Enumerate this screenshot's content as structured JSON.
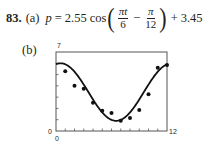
{
  "problem": {
    "number": "83.",
    "part_a_label": "(a)",
    "lhs": "p",
    "equals": "=",
    "amplitude": "2.55",
    "func": "cos",
    "frac1_num": "πt",
    "frac1_den": "6",
    "minus": "−",
    "frac2_num": "π",
    "frac2_den": "12",
    "plus": "+",
    "shift": "3.45",
    "part_b_label": "(b)"
  },
  "chart_data": {
    "type": "scatter",
    "title": "",
    "xlabel": "",
    "ylabel": "",
    "xlim": [
      0,
      12
    ],
    "ylim": [
      0,
      7
    ],
    "x_tick_labels": {
      "min": "0",
      "max": "12"
    },
    "y_tick_labels": {
      "min": "0",
      "max": "7"
    },
    "x_ticks": 12,
    "y_ticks": 7,
    "grid": false,
    "series": [
      {
        "name": "data",
        "type": "scatter",
        "x": [
          1,
          2,
          3,
          4,
          5,
          6,
          7,
          8,
          9,
          10,
          11,
          12
        ],
        "y": [
          5.3,
          4.0,
          3.75,
          2.5,
          1.8,
          1.6,
          0.9,
          1.15,
          1.85,
          3.25,
          5.6,
          5.85
        ]
      },
      {
        "name": "model",
        "type": "line",
        "formula": "p = 2.55 cos(πt/6 − π/12) + 3.45",
        "amplitude": 2.55,
        "period": 12,
        "phase": 0.2618,
        "vertical_shift": 3.45
      }
    ]
  }
}
